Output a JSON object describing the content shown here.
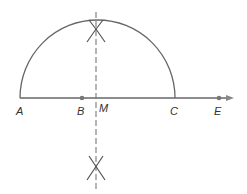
{
  "diagram": {
    "type": "geometric-construction",
    "colors": {
      "stroke": "#666666",
      "text": "#333333",
      "background": "#ffffff"
    },
    "points": [
      {
        "name": "A",
        "label": "A"
      },
      {
        "name": "B",
        "label": "B"
      },
      {
        "name": "M",
        "label": "M"
      },
      {
        "name": "C",
        "label": "C"
      },
      {
        "name": "E",
        "label": "E"
      }
    ],
    "elements": {
      "baseline": "ray from A through E with arrow",
      "semicircle": "arc over segment AC",
      "bisector": "dashed vertical line through M",
      "arc_marks": [
        "upper crossing arcs",
        "lower crossing arcs"
      ]
    }
  }
}
